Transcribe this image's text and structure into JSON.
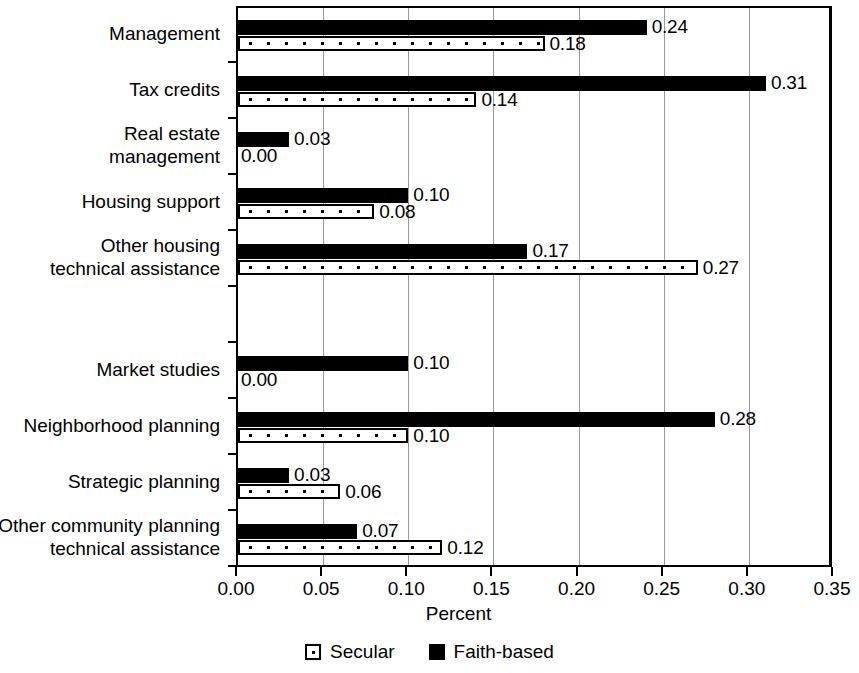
{
  "chart_data": {
    "type": "bar",
    "orientation": "horizontal",
    "title": "",
    "xlabel": "Percent",
    "ylabel": "",
    "xlim": [
      0,
      0.35
    ],
    "xticks": [
      "0.00",
      "0.05",
      "0.10",
      "0.15",
      "0.20",
      "0.25",
      "0.30",
      "0.35"
    ],
    "xtick_values": [
      0,
      0.05,
      0.1,
      0.15,
      0.2,
      0.25,
      0.3,
      0.35
    ],
    "grid": "vertical",
    "legend_position": "bottom-center",
    "legend": [
      "Secular",
      "Faith-based"
    ],
    "categories": [
      "Management",
      "Tax credits",
      "Real estate\nmanagement",
      "Housing support",
      "Other housing\ntechnical assistance",
      "",
      "Market studies",
      "Neighborhood planning",
      "Strategic planning",
      "Other community planning\ntechnical assistance"
    ],
    "series": [
      {
        "name": "Faith-based",
        "color": "#000000",
        "style": "solid-black",
        "values": [
          0.24,
          0.31,
          0.03,
          0.1,
          0.17,
          null,
          0.1,
          0.28,
          0.03,
          0.07
        ],
        "labels": [
          "0.24",
          "0.31",
          "0.03",
          "0.10",
          "0.17",
          "",
          "0.10",
          "0.28",
          "0.03",
          "0.07"
        ]
      },
      {
        "name": "Secular",
        "color": "#ffffff",
        "style": "white-dotted",
        "values": [
          0.18,
          0.14,
          0.0,
          0.08,
          0.27,
          null,
          0.0,
          0.1,
          0.06,
          0.12
        ],
        "labels": [
          "0.18",
          "0.14",
          "0.00",
          "0.08",
          "0.27",
          "",
          "0.00",
          "0.10",
          "0.06",
          "0.12"
        ]
      }
    ]
  }
}
